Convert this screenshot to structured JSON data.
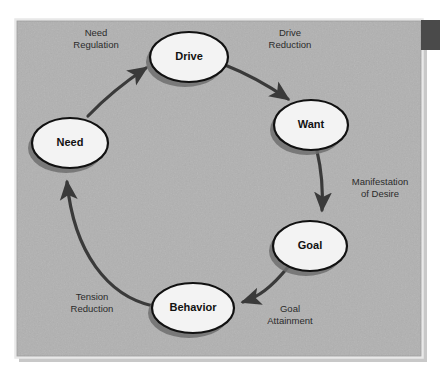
{
  "figure": {
    "type": "cycle-diagram",
    "canvas": {
      "width": 440,
      "height": 373
    },
    "panel": {
      "x": 15,
      "y": 19,
      "width": 408,
      "height": 339,
      "fill": "#adadad",
      "border": "#e8e8e8",
      "shadow": "#8d8d8d"
    },
    "corner_block": {
      "x": 421,
      "y": 20,
      "width": 19,
      "height": 30,
      "fill": "#4a4a4a"
    },
    "style": {
      "node_fill": "#f3f3f3",
      "node_stroke": "#111111",
      "node_shadow": "#6f6f6f",
      "arrow_color": "#3a3a3a",
      "label_color": "#2b2b2b",
      "node_text_color": "#111111"
    }
  },
  "nodes": [
    {
      "id": "drive",
      "label": "Drive",
      "cx": 189,
      "cy": 57,
      "rx": 39,
      "ry": 25
    },
    {
      "id": "want",
      "label": "Want",
      "cx": 311,
      "cy": 125,
      "rx": 37,
      "ry": 25
    },
    {
      "id": "goal",
      "label": "Goal",
      "cx": 310,
      "cy": 246,
      "rx": 37,
      "ry": 25
    },
    {
      "id": "behavior",
      "label": "Behavior",
      "cx": 193,
      "cy": 308,
      "rx": 41,
      "ry": 25
    },
    {
      "id": "need",
      "label": "Need",
      "cx": 70,
      "cy": 143,
      "rx": 38,
      "ry": 25
    }
  ],
  "edges": [
    {
      "id": "need-to-drive",
      "from": "need",
      "to": "drive",
      "label_line1": "Need",
      "label_line2": "Regulation",
      "label_x": 96,
      "label_y": 36,
      "path": "M 88 116 C 108 95, 128 80, 146 68"
    },
    {
      "id": "drive-to-want",
      "from": "drive",
      "to": "want",
      "label_line1": "Drive",
      "label_line2": "Reduction",
      "label_x": 290,
      "label_y": 36,
      "path": "M 225 65 C 253 76, 272 88, 288 99"
    },
    {
      "id": "want-to-goal",
      "from": "want",
      "to": "goal",
      "label_line1": "Manifestation",
      "label_line2": "of Desire",
      "label_x": 380,
      "label_y": 185,
      "path": "M 317 151 C 322 172, 323 192, 322 210"
    },
    {
      "id": "goal-to-behavior",
      "from": "goal",
      "to": "behavior",
      "label_line1": "Goal",
      "label_line2": "Attainment",
      "label_x": 290,
      "label_y": 312,
      "path": "M 288 267 C 271 288, 258 297, 243 302"
    },
    {
      "id": "behavior-to-need",
      "from": "behavior",
      "to": "need",
      "label_line1": "Tension",
      "label_line2": "Reduction",
      "label_x": 92,
      "label_y": 300,
      "path": "M 153 306 C 108 296, 74 253, 67 182"
    }
  ]
}
